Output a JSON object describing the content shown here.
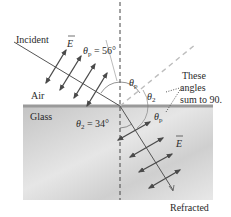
{
  "labels": {
    "incident": "Incident",
    "refracted": "Refracted",
    "air": "Air",
    "glass": "Glass",
    "e_field_incident": "E",
    "e_field_refracted": "E",
    "theta_p_eq": "θ",
    "theta_p_sub": "p",
    "theta_p_value": " = 56°",
    "theta_2": "θ",
    "theta_2_sub": "2",
    "theta_2_value": " = 34°",
    "theta_p_upper": "θ",
    "theta_p_upper_sub": "p",
    "theta_2_upper": "θ",
    "theta_2_upper_sub": "2",
    "theta_p_lower": "θ",
    "theta_p_lower_sub": "p",
    "note_line1": "These",
    "note_line2": "angles",
    "note_line3": "sum to 90."
  },
  "colors": {
    "glass_top": "#bdbdbd",
    "glass_bottom": "#e4e4e4",
    "interface": "#8a8a8a",
    "ray": "#555555",
    "arrow": "#4a4a4a",
    "reflected": "#b8b8b8",
    "normal": "#444444",
    "text": "#2a2a2a"
  },
  "angles": {
    "brewster_angle_deg": 56,
    "refraction_angle_deg": 34
  }
}
